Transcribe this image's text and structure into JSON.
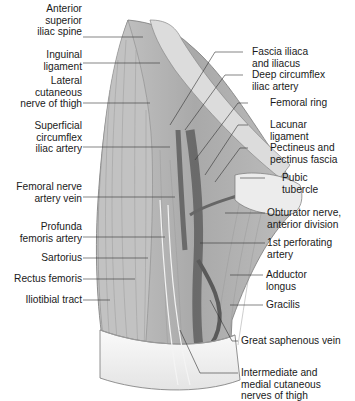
{
  "figure": {
    "colors": {
      "muscle": "#b9b9b9",
      "muscle_dark": "#8f8f8f",
      "vessel": "#6e6e6e",
      "bone": "#e9e9e9",
      "skin": "#f2f2f2",
      "line": "#333333"
    }
  },
  "labels_left": [
    {
      "id": "asis",
      "lines": [
        "Anterior",
        "superior",
        "iliac spine"
      ]
    },
    {
      "id": "inguinal",
      "lines": [
        "Inguinal",
        "ligament"
      ]
    },
    {
      "id": "lcn",
      "lines": [
        "Lateral",
        "cutaneous",
        "nerve of thigh"
      ]
    },
    {
      "id": "scia",
      "lines": [
        "Superficial",
        "circumflex",
        "iliac artery"
      ]
    },
    {
      "id": "fnav",
      "lines": [
        "Femoral nerve",
        "artery vein"
      ]
    },
    {
      "id": "pfa",
      "lines": [
        "Profunda",
        "femoris artery"
      ]
    },
    {
      "id": "sartorius",
      "lines": [
        "Sartorius"
      ]
    },
    {
      "id": "rectus",
      "lines": [
        "Rectus femoris"
      ]
    },
    {
      "id": "itt",
      "lines": [
        "Iliotibial tract"
      ]
    }
  ],
  "labels_right": [
    {
      "id": "fascia",
      "lines": [
        "Fascia iliaca",
        "and iliacus"
      ]
    },
    {
      "id": "dcia",
      "lines": [
        "Deep circumflex",
        "iliac artery"
      ]
    },
    {
      "id": "ring",
      "lines": [
        "Femoral ring"
      ]
    },
    {
      "id": "lacunar",
      "lines": [
        "Lacunar",
        "ligament"
      ]
    },
    {
      "id": "pectineus",
      "lines": [
        "Pectineus and",
        "pectinus fascia"
      ]
    },
    {
      "id": "pubic",
      "lines": [
        "Pubic",
        "tubercle"
      ]
    },
    {
      "id": "obturator",
      "lines": [
        "Obturator nerve,",
        "anterior division"
      ]
    },
    {
      "id": "perforating",
      "lines": [
        "1st perforating",
        "artery"
      ]
    },
    {
      "id": "adductor",
      "lines": [
        "Adductor",
        "longus"
      ]
    },
    {
      "id": "gracilis",
      "lines": [
        "Gracilis"
      ]
    },
    {
      "id": "gsv",
      "lines": [
        "Great saphenous vein"
      ]
    },
    {
      "id": "imcn",
      "lines": [
        "Intermediate and",
        "medial cutaneous",
        "nerves of thigh"
      ]
    }
  ]
}
